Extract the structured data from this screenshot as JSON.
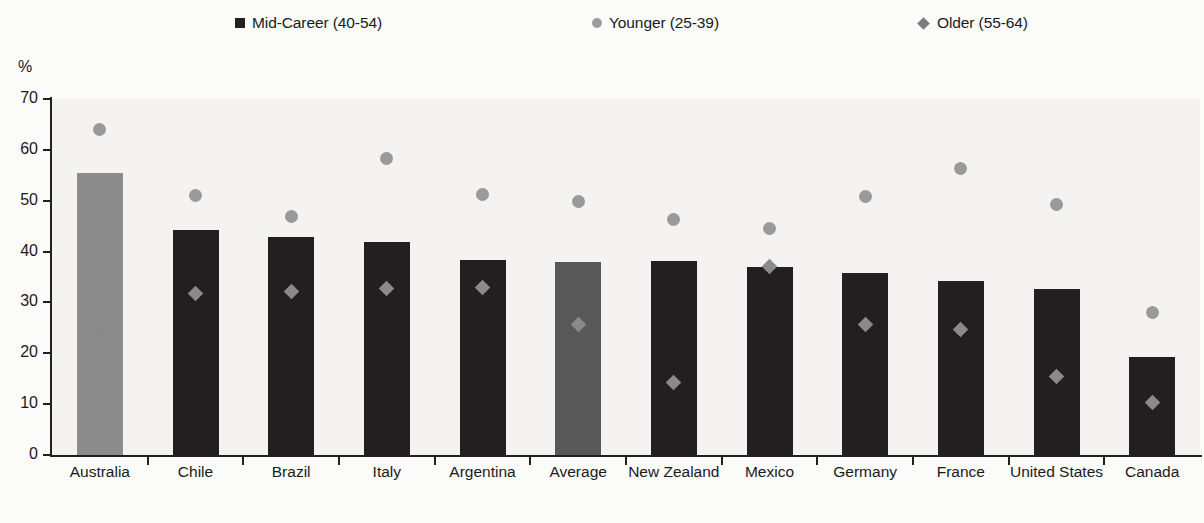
{
  "chart_data": {
    "type": "bar",
    "title": "",
    "subtitle": "",
    "xlabel": "",
    "ylabel": "%",
    "ylim": [
      0,
      70
    ],
    "ytick_step": 10,
    "yticks": [
      0,
      10,
      20,
      30,
      40,
      50,
      60,
      70
    ],
    "grid": false,
    "legend_position": "top",
    "categories": [
      "Australia",
      "Chile",
      "Brazil",
      "Italy",
      "Argentina",
      "Average",
      "New Zealand",
      "Mexico",
      "Germany",
      "France",
      "United States",
      "Canada"
    ],
    "series": [
      {
        "name": "Mid-Career (40-54)",
        "marker": "square",
        "render": "bar",
        "color": "#231f20",
        "values": [
          55.5,
          44.2,
          42.8,
          41.8,
          38.3,
          38.0,
          38.1,
          37.0,
          35.7,
          34.2,
          32.7,
          19.2
        ]
      },
      {
        "name": "Younger (25-39)",
        "marker": "circle",
        "render": "point",
        "color": "#9a9a9a",
        "values": [
          64.0,
          51.0,
          46.8,
          58.3,
          51.3,
          49.8,
          46.4,
          44.5,
          50.9,
          56.4,
          49.2,
          28.0
        ]
      },
      {
        "name": "Older (55-64)",
        "marker": "diamond",
        "render": "point",
        "color": "#8a8a8a",
        "values": [
          24.0,
          31.7,
          32.2,
          32.7,
          33.0,
          25.6,
          14.3,
          37.0,
          25.6,
          24.7,
          15.4,
          10.3
        ]
      }
    ],
    "highlighted_bars": {
      "Australia": "#8c8c8c",
      "Average": "#585858"
    }
  },
  "axis": {
    "unit_label": "%"
  },
  "legend": {
    "items": [
      {
        "label": "Mid-Career (40-54)",
        "marker": "square",
        "color": "#231f20"
      },
      {
        "label": "Younger (25-39)",
        "marker": "circle",
        "color": "#9d9d9d"
      },
      {
        "label": "Older (55-64)",
        "marker": "diamond",
        "color": "#7d7d7d"
      }
    ]
  }
}
